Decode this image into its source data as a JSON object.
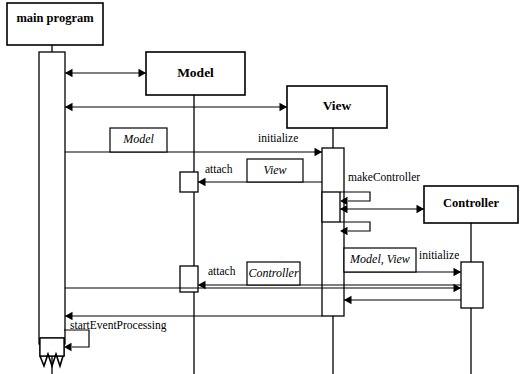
{
  "diagram": {
    "type": "uml-sequence-diagram",
    "canvas": {
      "width": 525,
      "height": 374
    },
    "stroke_color": "#000000",
    "background_color": "#ffffff",
    "participants": [
      {
        "id": "main-program",
        "label": "main program",
        "box": {
          "x": 7,
          "y": 3,
          "w": 96,
          "h": 42
        },
        "lifeline_x": 52,
        "lifeline_y1": 45,
        "lifeline_y2": 374,
        "bold": true
      },
      {
        "id": "model",
        "label": "Model",
        "box": {
          "x": 146,
          "y": 52,
          "w": 99,
          "h": 43
        },
        "lifeline_x": 194,
        "lifeline_y1": 95,
        "lifeline_y2": 374,
        "bold": true
      },
      {
        "id": "view",
        "label": "View",
        "box": {
          "x": 287,
          "y": 86,
          "w": 100,
          "h": 42
        },
        "lifeline_x": 333,
        "lifeline_y1": 128,
        "lifeline_y2": 374,
        "bold": true
      },
      {
        "id": "controller",
        "label": "Controller",
        "box": {
          "x": 424,
          "y": 186,
          "w": 94,
          "h": 37
        },
        "lifeline_x": 471,
        "lifeline_y1": 223,
        "lifeline_y2": 374,
        "bold": true
      }
    ],
    "activations": [
      {
        "id": "main-activation",
        "owner": "main-program",
        "x": 39,
        "y": 52,
        "w": 26,
        "h": 292
      },
      {
        "id": "model-attach-view-activation",
        "owner": "model",
        "x": 180,
        "y": 172,
        "w": 18,
        "h": 20
      },
      {
        "id": "model-attach-controller-activation",
        "owner": "model",
        "x": 180,
        "y": 266,
        "w": 18,
        "h": 26
      },
      {
        "id": "view-initialize-activation",
        "owner": "view",
        "x": 322,
        "y": 148,
        "w": 22,
        "h": 168
      },
      {
        "id": "view-makecontroller-activation",
        "owner": "view",
        "x": 322,
        "y": 192,
        "w": 18,
        "h": 30
      },
      {
        "id": "controller-initialize-activation",
        "owner": "controller",
        "x": 461,
        "y": 262,
        "w": 22,
        "h": 46
      },
      {
        "id": "main-starteventprocessing-activation",
        "owner": "main-program",
        "x": 40,
        "y": 338,
        "w": 24,
        "h": 18
      }
    ],
    "messages": [
      {
        "id": "msg-create-model",
        "label": "",
        "from": "main-program",
        "to": "model",
        "x1": 65,
        "x2": 146,
        "y": 73,
        "arrow": "both"
      },
      {
        "id": "msg-create-view",
        "label": "",
        "from": "main-program",
        "to": "view",
        "x1": 65,
        "x2": 287,
        "y": 107,
        "arrow": "both"
      },
      {
        "id": "msg-view-initialize",
        "label": "initialize",
        "label_x": 258,
        "label_y": 139,
        "from": "main-program",
        "to": "view",
        "x1": 65,
        "x2": 322,
        "y": 152,
        "arrow": "forward"
      },
      {
        "id": "msg-model-attach-view",
        "label": "attach",
        "label_x": 205,
        "label_y": 170,
        "from": "view",
        "to": "model",
        "x1": 322,
        "x2": 198,
        "y": 182,
        "arrow": "backward"
      },
      {
        "id": "msg-view-makecontroller",
        "label": "makeController",
        "label_x": 348,
        "label_y": 178,
        "from": "view",
        "to": "view",
        "x1": 340,
        "x2": 370,
        "y": 192,
        "y2": 201,
        "arrow": "self"
      },
      {
        "id": "msg-view-controller-create",
        "label": "",
        "from": "view",
        "to": "controller",
        "x1": 340,
        "x2": 424,
        "y": 209,
        "arrow": "both"
      },
      {
        "id": "msg-view-makecontroller-return",
        "label": "",
        "from": "view",
        "to": "view",
        "x1": 340,
        "x2": 370,
        "y": 222,
        "y2": 231,
        "arrow": "self"
      },
      {
        "id": "msg-controller-initialize",
        "label": "initialize",
        "label_x": 419,
        "label_y": 256,
        "from": "view",
        "to": "controller",
        "x1": 344,
        "x2": 461,
        "y": 272,
        "arrow": "forward"
      },
      {
        "id": "msg-main-controller",
        "label": "",
        "from": "main-program",
        "to": "controller",
        "x1": 65,
        "x2": 461,
        "y": 288,
        "arrow": "forward"
      },
      {
        "id": "msg-model-attach-controller",
        "label": "attach",
        "label_x": 208,
        "label_y": 272,
        "from": "controller",
        "to": "model",
        "x1": 461,
        "x2": 198,
        "y": 285,
        "arrow": "backward"
      },
      {
        "id": "msg-controller-return",
        "label": "",
        "from": "controller",
        "to": "view",
        "x1": 461,
        "x2": 344,
        "y": 300,
        "arrow": "backward"
      },
      {
        "id": "msg-view-return-main",
        "label": "",
        "from": "view",
        "to": "main-program",
        "x1": 322,
        "x2": 65,
        "y": 316,
        "arrow": "backward"
      },
      {
        "id": "msg-starteventprocessing",
        "label": "startEventProcessing",
        "label_x": 70,
        "label_y": 326,
        "from": "main-program",
        "to": "main-program",
        "x1": 64,
        "x2": 89,
        "y": 330,
        "y2": 347,
        "arrow": "self"
      }
    ],
    "parameter_boxes": [
      {
        "id": "param-model",
        "label": "Model",
        "x": 110,
        "y": 128,
        "w": 57,
        "h": 24
      },
      {
        "id": "param-view",
        "label": "View",
        "x": 247,
        "y": 159,
        "w": 56,
        "h": 23
      },
      {
        "id": "param-controller",
        "label": "Controller",
        "x": 247,
        "y": 262,
        "w": 53,
        "h": 23
      },
      {
        "id": "param-model-view",
        "label": "Model, View",
        "x": 344,
        "y": 248,
        "w": 72,
        "h": 24
      }
    ],
    "terminator": {
      "id": "main-program-terminator",
      "description": "zigzag end-of-lifeline marker",
      "box": {
        "x": 40,
        "y": 338,
        "w": 24,
        "h": 18
      },
      "zigzag_path": "M 40 356 L 44 366 L 48 354 L 52 366 L 56 354 L 60 366 L 63 356"
    }
  }
}
